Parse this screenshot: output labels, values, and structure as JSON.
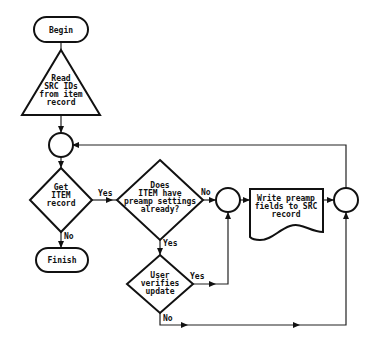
{
  "diagram": {
    "type": "flowchart",
    "nodes": {
      "begin": {
        "shape": "terminator",
        "label": "Begin"
      },
      "read": {
        "shape": "triangle",
        "lines": [
          "Read",
          "SRC IDs",
          "from item",
          "record"
        ]
      },
      "junction1": {
        "shape": "connector"
      },
      "get_item": {
        "shape": "decision",
        "lines": [
          "Get",
          "ITEM",
          "record"
        ]
      },
      "has_settings": {
        "shape": "decision",
        "lines": [
          "Does",
          "ITEM have",
          "preamp settings",
          "already?"
        ]
      },
      "junction2": {
        "shape": "connector"
      },
      "write": {
        "shape": "document",
        "lines": [
          "Write preamp",
          "fields to SRC",
          "record"
        ]
      },
      "junction3": {
        "shape": "connector"
      },
      "finish": {
        "shape": "terminator",
        "label": "Finish"
      },
      "verify": {
        "shape": "decision",
        "lines": [
          "User",
          "verifies",
          "update"
        ]
      }
    },
    "edge_labels": {
      "get_item_yes": "Yes",
      "get_item_no": "No",
      "has_settings_no": "No",
      "has_settings_yes": "Yes",
      "verify_yes": "Yes",
      "verify_no": "No"
    },
    "edges": [
      {
        "from": "begin",
        "to": "read"
      },
      {
        "from": "read",
        "to": "junction1"
      },
      {
        "from": "junction1",
        "to": "get_item"
      },
      {
        "from": "get_item",
        "to": "has_settings",
        "label": "Yes"
      },
      {
        "from": "get_item",
        "to": "finish",
        "label": "No"
      },
      {
        "from": "has_settings",
        "to": "junction2",
        "label": "No"
      },
      {
        "from": "has_settings",
        "to": "verify",
        "label": "Yes"
      },
      {
        "from": "verify",
        "to": "junction2",
        "label": "Yes"
      },
      {
        "from": "verify",
        "to": "junction3",
        "label": "No"
      },
      {
        "from": "junction2",
        "to": "write"
      },
      {
        "from": "write",
        "to": "junction3"
      },
      {
        "from": "junction3",
        "to": "junction1"
      }
    ]
  }
}
